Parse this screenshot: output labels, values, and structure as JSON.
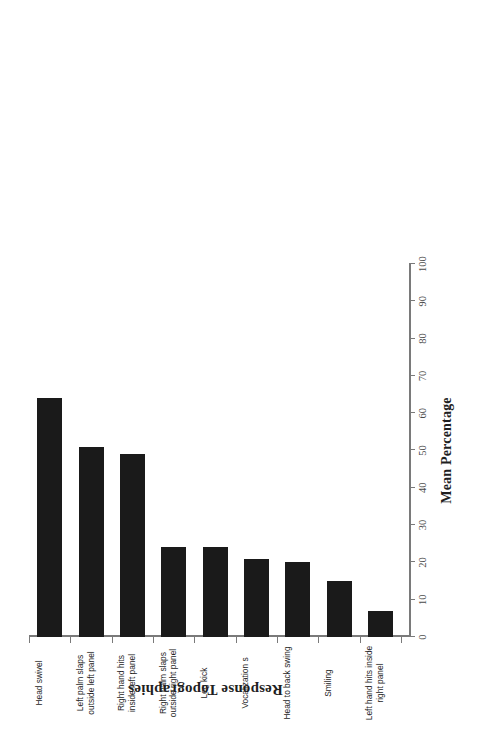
{
  "chart_data": {
    "type": "bar",
    "orientation": "horizontal",
    "title": "",
    "xlabel": "Mean Percentage",
    "ylabel": "Response Topographies",
    "xlim": [
      0,
      100
    ],
    "xticks": [
      0,
      10,
      20,
      30,
      40,
      50,
      60,
      70,
      80,
      90,
      100
    ],
    "grid": false,
    "legend": false,
    "bar_color": "#1a1a1a",
    "categories": [
      "Head swivel",
      "Left palm slaps outside left panel",
      "Right hand hits inside left panel",
      "Right palm slaps outside right panel",
      "Leg kick",
      "Vocalization s",
      "Head to back swing",
      "Smiling",
      "Left hand hits inside right panel"
    ],
    "values": [
      64,
      51,
      49,
      24,
      24,
      21,
      20,
      15,
      7
    ]
  },
  "axes": {
    "value_axis_title": "Mean Percentage",
    "category_axis_title": "Response Topographies",
    "value_ticks": [
      "0",
      "10",
      "20",
      "30",
      "40",
      "50",
      "60",
      "70",
      "80",
      "90",
      "100"
    ]
  },
  "categories": [
    {
      "label": "Head swivel",
      "value": 64
    },
    {
      "label": "Left palm slaps outside left panel",
      "value": 51
    },
    {
      "label": "Right hand hits inside left panel",
      "value": 49
    },
    {
      "label": "Right palm slaps outside right panel",
      "value": 24
    },
    {
      "label": "Leg kick",
      "value": 24
    },
    {
      "label": "Vocalization s",
      "value": 21
    },
    {
      "label": "Head to back swing",
      "value": 20
    },
    {
      "label": "Smiling",
      "value": 15
    },
    {
      "label": "Left hand hits inside right panel",
      "value": 7
    }
  ]
}
